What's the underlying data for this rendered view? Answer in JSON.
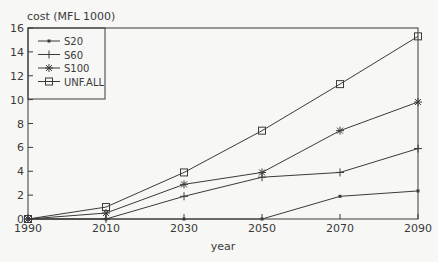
{
  "chart_data": {
    "type": "line",
    "title": "",
    "ylabel": "cost (MFL 1000)",
    "xlabel": "year",
    "x": [
      1990,
      2010,
      2030,
      2050,
      2070,
      2090
    ],
    "xticks": [
      "1990",
      "2010",
      "2030",
      "2050",
      "2070",
      "2090"
    ],
    "yticks": [
      "0",
      "2",
      "4",
      "6",
      "8",
      "10",
      "12",
      "14",
      "16"
    ],
    "ylim": [
      0,
      16
    ],
    "xlim": [
      1990,
      2090
    ],
    "grid": false,
    "legend_position": "upper left",
    "series": [
      {
        "name": "S20",
        "marker": "dot",
        "values": [
          0,
          0,
          0,
          0,
          1.9,
          2.35
        ]
      },
      {
        "name": "S60",
        "marker": "plus",
        "values": [
          0,
          0,
          1.9,
          3.5,
          3.9,
          5.9
        ]
      },
      {
        "name": "S100",
        "marker": "asterisk",
        "values": [
          0,
          0.5,
          2.9,
          3.9,
          7.4,
          9.8
        ]
      },
      {
        "name": "UNF.ALL",
        "marker": "square",
        "values": [
          0,
          1.0,
          3.9,
          7.4,
          11.3,
          15.3
        ]
      }
    ]
  },
  "colors": {
    "line": "#3a3a3a",
    "background": "#f7f7f5"
  }
}
